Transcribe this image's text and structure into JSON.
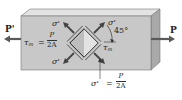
{
  "diagram": {
    "loads": {
      "left": {
        "label": "P'",
        "direction": "left"
      },
      "right": {
        "label": "P",
        "direction": "right"
      }
    },
    "shear_label": {
      "symbol": "τ",
      "subscript": "m",
      "equals": "=",
      "numerator": "P",
      "denominator": "2A"
    },
    "shear_label_right": {
      "symbol": "τ",
      "subscript": "m"
    },
    "normal_stress_labels": [
      "σ'",
      "σ'",
      "σ'"
    ],
    "angle_label": "45°",
    "normal_equation": {
      "symbol": "σ'",
      "equals": "=",
      "numerator": "P",
      "denominator": "2A"
    },
    "colors": {
      "front_face": "#c9c9c9",
      "top_face": "#e4e4e4",
      "side_face": "#a8a8a8",
      "arrow": "#555555",
      "element_fill": "#bdbdbd",
      "element_highlight": "#e9e9e9"
    }
  }
}
